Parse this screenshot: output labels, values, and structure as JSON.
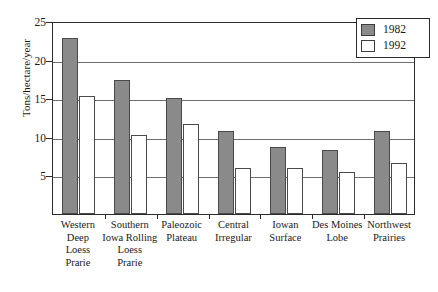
{
  "chart_data": {
    "type": "bar",
    "title": "",
    "xlabel": "",
    "ylabel": "Tons/hectare/year",
    "ylim": [
      0,
      25
    ],
    "yticks": [
      0,
      5,
      10,
      15,
      20,
      25
    ],
    "ytick_labels": [
      "",
      "5",
      "10",
      "15",
      "20",
      "25"
    ],
    "grid": true,
    "legend_position": "top-right",
    "categories": [
      "Western Deep Loess Prarie",
      "Southern Iowa Rolling Loess Prarie",
      "Paleozoic Plateau",
      "Central Irregular",
      "Iowan Surface",
      "Des Moines Lobe",
      "Northwest Prairies"
    ],
    "category_lines": [
      [
        "Western",
        "Deep",
        "Loess",
        "Prarie"
      ],
      [
        "Southern",
        "Iowa Rolling",
        "Loess",
        "Prarie"
      ],
      [
        "Paleozoic",
        "Plateau"
      ],
      [
        "Central",
        "Irregular"
      ],
      [
        "Iowan",
        "Surface"
      ],
      [
        "Des Moines",
        "Lobe"
      ],
      [
        "Northwest",
        "Prairies"
      ]
    ],
    "series": [
      {
        "name": "1982",
        "color": "#8a8a8a",
        "values": [
          22.8,
          17.3,
          15.0,
          10.8,
          8.7,
          8.3,
          10.8
        ]
      },
      {
        "name": "1992",
        "color": "#ffffff",
        "values": [
          15.3,
          10.2,
          11.7,
          6.0,
          6.0,
          5.4,
          6.6
        ]
      }
    ]
  },
  "legend": {
    "items": [
      {
        "label": "1982",
        "swatch": "filled-gray"
      },
      {
        "label": "1992",
        "swatch": "empty-white"
      }
    ]
  }
}
